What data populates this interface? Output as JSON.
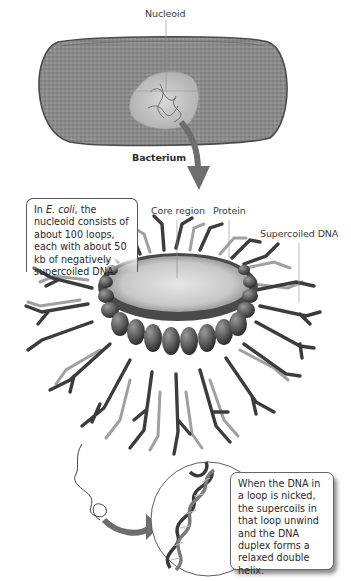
{
  "figure": {
    "labels": {
      "nucleoid": "Nucleoid",
      "bacterium": "Bacterium",
      "core_region": "Core region",
      "protein": "Protein",
      "supercoiled_dna": "Supercoiled DNA"
    },
    "callouts": {
      "ecoli": {
        "prefix": "In ",
        "italic": "E. coli",
        "text": ", the nucleoid consists of about 100 loops, each with about 50 kb of negatively supercoiled DNA."
      },
      "nicked": {
        "text": "When the DNA in a loop is nicked, the supercoils in that loop unwind and the DNA duplex forms a relaxed double helix."
      }
    },
    "colors": {
      "cell_fill": "#8a8a8a",
      "cell_outline": "#4a4a4a",
      "nucleoid_fill": "#c8c8c8",
      "arrow": "#6e6e6e",
      "protein_bead": "#5a5a5a",
      "core_fill": "#d4d4d4",
      "dna_dark": "#3a3a3a",
      "dna_light": "#9a9a9a",
      "leader_line": "#7a7a7a"
    }
  }
}
